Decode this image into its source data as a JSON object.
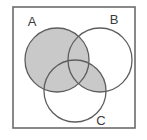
{
  "figure": {
    "type": "venn-diagram",
    "set_count": 3,
    "title": "",
    "universe_label": "",
    "colors": {
      "shade": "#c9c9c9",
      "stroke": "#5e5e5e",
      "frame": "#6b6b6b",
      "background": "#ffffff",
      "label_color": "#3b3b3b"
    }
  },
  "frame": {
    "name": "universal-set-rectangle",
    "x": 13,
    "y": 7,
    "width": 122,
    "height": 121
  },
  "sets": [
    {
      "id": "A",
      "label": "A",
      "cx": 57,
      "cy": 60,
      "r": 32,
      "label_x": 32,
      "label_y": 26
    },
    {
      "id": "B",
      "label": "B",
      "cx": 100,
      "cy": 60,
      "r": 32,
      "label_x": 114,
      "label_y": 24
    },
    {
      "id": "C",
      "label": "C",
      "cx": 75,
      "cy": 91,
      "r": 31,
      "label_x": 101,
      "label_y": 125
    }
  ],
  "regions": [
    {
      "id": "A-only",
      "expression": "A \\ (B ∪ C)",
      "shaded": true
    },
    {
      "id": "A-and-B",
      "expression": "(A ∩ B) \\ C",
      "shaded": true
    },
    {
      "id": "A-and-C",
      "expression": "(A ∩ C) \\ B",
      "shaded": true
    },
    {
      "id": "A-B-C",
      "expression": "A ∩ B ∩ C",
      "shaded": true
    },
    {
      "id": "B-and-C",
      "expression": "(B ∩ C) \\ A",
      "shaded": true
    },
    {
      "id": "B-only",
      "expression": "B \\ (A ∪ C)",
      "shaded": false
    },
    {
      "id": "C-only",
      "expression": "C \\ (A ∪ B)",
      "shaded": false
    },
    {
      "id": "outside",
      "expression": "U \\ (A ∪ B ∪ C)",
      "shaded": false
    }
  ],
  "shaded_set_expression": "A ∪ (B ∩ C)"
}
